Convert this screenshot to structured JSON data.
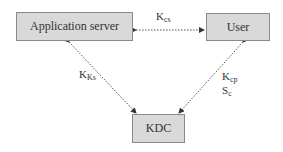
{
  "diagram": {
    "nodes": {
      "app_server": "Application server",
      "user": "User",
      "kdc": "KDC"
    },
    "edges": {
      "app_user": {
        "main": "K",
        "sub": "cs"
      },
      "app_kdc": {
        "main": "K",
        "sub": "Ks"
      },
      "user_kdc_1": {
        "main": "K",
        "sub": "cp"
      },
      "user_kdc_2": {
        "main": "S",
        "sub": "c"
      }
    },
    "colors": {
      "box_fill": "#d9d9d9",
      "box_border": "#8a8a8a",
      "line": "#555555"
    }
  }
}
